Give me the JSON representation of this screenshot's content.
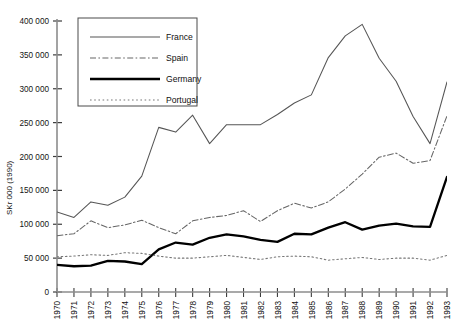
{
  "chart_data": {
    "type": "line",
    "title": "",
    "xlabel": "",
    "ylabel": "SKr 000 (1990)",
    "ylim": [
      0,
      400000
    ],
    "xlim": [
      1970,
      1993
    ],
    "grid": false,
    "legend_position": "upper-left-inside",
    "y_ticks": [
      0,
      50000,
      100000,
      150000,
      200000,
      250000,
      300000,
      350000,
      400000
    ],
    "y_tick_labels": [
      "0",
      "50 000",
      "100 000",
      "150 000",
      "200 000",
      "250 000",
      "300 000",
      "350 000",
      "400 000"
    ],
    "x": [
      1970,
      1971,
      1972,
      1973,
      1974,
      1975,
      1976,
      1977,
      1978,
      1979,
      1980,
      1981,
      1982,
      1983,
      1984,
      1985,
      1986,
      1987,
      1988,
      1989,
      1990,
      1991,
      1992,
      1993
    ],
    "x_tick_labels": [
      "1970",
      "1971",
      "1972",
      "1973",
      "1974",
      "1975",
      "1976",
      "1977",
      "1978",
      "1979",
      "1980",
      "1981",
      "1982",
      "1983",
      "1984",
      "1985",
      "1986",
      "1987",
      "1988",
      "1989",
      "1990",
      "1991",
      "1992",
      "1993"
    ],
    "series": [
      {
        "name": "France",
        "style": "thin-solid",
        "color": "#555555",
        "values": [
          118000,
          110000,
          133000,
          128000,
          140000,
          171000,
          243000,
          236000,
          261000,
          219000,
          247000,
          247000,
          247000,
          262000,
          279000,
          291000,
          346000,
          378000,
          395000,
          345000,
          311000,
          259000,
          219000,
          310000
        ]
      },
      {
        "name": "Spain",
        "style": "dash-dot",
        "color": "#666666",
        "values": [
          83000,
          86000,
          105000,
          95000,
          99000,
          106000,
          95000,
          86000,
          105000,
          110000,
          113000,
          120000,
          104000,
          120000,
          131000,
          124000,
          133000,
          152000,
          174000,
          199000,
          205000,
          190000,
          194000,
          260000
        ]
      },
      {
        "name": "Germany",
        "style": "thick-solid",
        "color": "#000000",
        "values": [
          40000,
          38000,
          39000,
          46000,
          45000,
          41000,
          63000,
          73000,
          70000,
          80000,
          85000,
          82000,
          77000,
          74000,
          86000,
          85000,
          95000,
          103000,
          92000,
          98000,
          101000,
          97000,
          96000,
          170000
        ]
      },
      {
        "name": "Portugal",
        "style": "dotted",
        "color": "#777777",
        "values": [
          52000,
          53000,
          55000,
          54000,
          58000,
          57000,
          53000,
          50000,
          50000,
          52000,
          54000,
          51000,
          48000,
          52000,
          53000,
          52000,
          47000,
          49000,
          51000,
          48000,
          50000,
          50000,
          47000,
          54000
        ]
      }
    ]
  },
  "legend": {
    "entries": [
      {
        "label": "France"
      },
      {
        "label": "Spain"
      },
      {
        "label": "Germany"
      },
      {
        "label": "Portugal"
      }
    ]
  },
  "axes": {
    "y_title": "SKr 000 (1990)"
  }
}
